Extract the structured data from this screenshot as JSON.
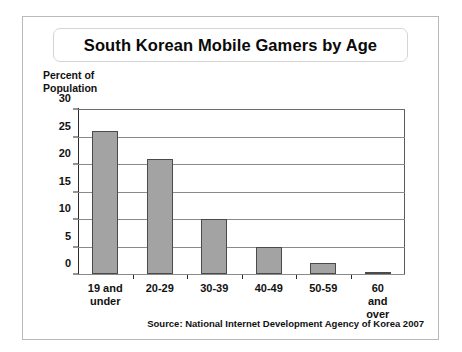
{
  "chart_data": {
    "type": "bar",
    "title": "South Korean Mobile Gamers by Age",
    "categories": [
      "19 and\nunder",
      "20-29",
      "30-39",
      "40-49",
      "50-59",
      "60 and\nover"
    ],
    "values": [
      26,
      21,
      10,
      5,
      2,
      0.2
    ],
    "xlabel": "",
    "ylabel": "Percent of\nPopulation",
    "ylim": [
      0,
      30
    ],
    "yticks": [
      0,
      5,
      10,
      15,
      20,
      25,
      30
    ],
    "ytick_labels": [
      "0",
      "5",
      "10",
      "15",
      "20",
      "25",
      "30"
    ],
    "grid": true,
    "legend": false,
    "source": "Source: National Internet Development Agency of Korea 2007",
    "bar_color": "#a3a3a3",
    "bar_edge_color": "#4a4a4a",
    "grid_color": "#8a8a8a",
    "axis_color": "#2b2b2b",
    "background": "#ffffff"
  }
}
